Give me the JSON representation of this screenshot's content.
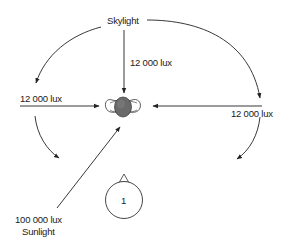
{
  "diagram": {
    "labels": {
      "skylight": "Skylight",
      "top_lux": "12 000 lux",
      "left_lux": "12 000 lux",
      "right_lux": "12 000 lux",
      "sun_lux": "100 000 lux",
      "sunlight": "Sunlight",
      "observer_number": "1"
    },
    "nodes": [
      {
        "id": "skylight",
        "label": "Skylight"
      },
      {
        "id": "subject-head",
        "label": "Subject (top view of head and shoulders)"
      },
      {
        "id": "observer",
        "label": "1"
      },
      {
        "id": "sunlight",
        "label": "Sunlight"
      }
    ],
    "edges": [
      {
        "from": "skylight",
        "to": "subject-head",
        "label": "12 000 lux",
        "direction": "from above"
      },
      {
        "from": "skylight",
        "to": "left-side",
        "label": "12 000 lux",
        "direction": "from left"
      },
      {
        "from": "skylight",
        "to": "right-side",
        "label": "12 000 lux",
        "direction": "from right"
      },
      {
        "from": "sunlight",
        "to": "subject-head",
        "label": "100 000 lux",
        "direction": "diagonal from lower left"
      }
    ]
  }
}
